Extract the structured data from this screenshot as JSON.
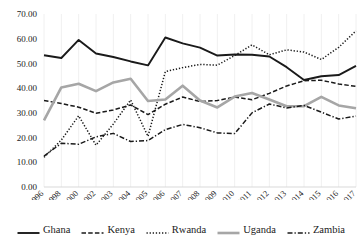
{
  "chart_data": {
    "type": "line",
    "title": "",
    "xlabel": "",
    "ylabel": "",
    "ylim": [
      0,
      70
    ],
    "ytick_step": 10,
    "grid": true,
    "legend_position": "bottom",
    "categories": [
      "1996",
      "1998",
      "2000",
      "2002",
      "2003",
      "2004",
      "2005",
      "2006",
      "2007",
      "2008",
      "2009",
      "2010",
      "2011",
      "2012",
      "2013",
      "2014",
      "2015",
      "2016",
      "2017"
    ],
    "yticks": [
      "0.00",
      "10.00",
      "20.00",
      "30.00",
      "40.00",
      "50.00",
      "60.00",
      "70.00"
    ],
    "series": [
      {
        "name": "Ghana",
        "style": "solid",
        "color": "#1a1a1a",
        "width": 1.9,
        "values": [
          53.3,
          52.2,
          59.5,
          54.0,
          52.6,
          50.8,
          49.2,
          60.5,
          58.1,
          56.4,
          53.2,
          53.6,
          53.5,
          52.8,
          48.5,
          43.3,
          44.8,
          45.3,
          49.0
        ]
      },
      {
        "name": "Kenya",
        "style": "dashed",
        "color": "#1a1a1a",
        "width": 1.5,
        "values": [
          35.0,
          33.8,
          32.3,
          29.8,
          31.2,
          33.2,
          29.3,
          33.5,
          36.4,
          34.6,
          35.0,
          36.4,
          35.3,
          37.9,
          40.9,
          43.0,
          43.2,
          41.7,
          40.7
        ]
      },
      {
        "name": "Rwanda",
        "style": "dotted",
        "color": "#1a1a1a",
        "width": 1.5,
        "values": [
          12.0,
          19.0,
          28.8,
          16.9,
          25.5,
          35.2,
          20.5,
          46.7,
          48.3,
          49.6,
          49.3,
          53.2,
          57.5,
          53.5,
          55.5,
          54.6,
          51.6,
          56.5,
          63.2
        ]
      },
      {
        "name": "Uganda",
        "style": "solid",
        "color": "#a6a6a6",
        "width": 2.6,
        "values": [
          27.0,
          40.3,
          41.8,
          38.8,
          42.3,
          43.8,
          34.8,
          35.4,
          41.0,
          35.0,
          32.2,
          36.6,
          38.0,
          35.4,
          32.7,
          32.7,
          36.5,
          33.0,
          31.9
        ]
      },
      {
        "name": "Zambia",
        "style": "dashdot",
        "color": "#1a1a1a",
        "width": 1.5,
        "values": [
          12.5,
          17.7,
          17.3,
          20.3,
          21.7,
          18.4,
          18.8,
          23.2,
          25.3,
          24.0,
          21.9,
          21.6,
          30.0,
          33.6,
          32.0,
          33.0,
          30.3,
          27.5,
          28.7
        ]
      }
    ]
  },
  "legend": {
    "items": [
      {
        "label": "Ghana",
        "swatch": "solid-black-line"
      },
      {
        "label": "Kenya",
        "swatch": "dashed-black-line"
      },
      {
        "label": "Rwanda",
        "swatch": "dotted-black-line"
      },
      {
        "label": "Uganda",
        "swatch": "solid-gray-line"
      },
      {
        "label": "Zambia",
        "swatch": "dashdot-black-line"
      }
    ]
  }
}
